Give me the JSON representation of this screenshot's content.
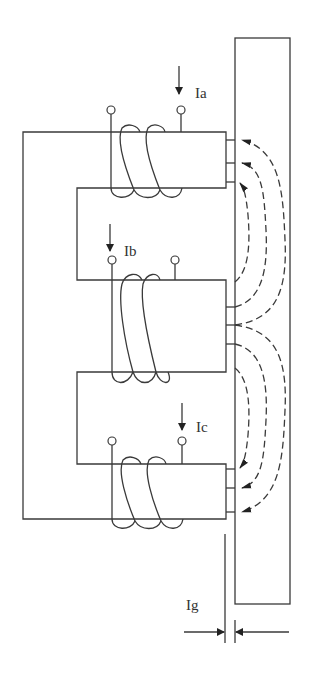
{
  "diagram": {
    "labels": {
      "phase_a_current": "Ia",
      "phase_b_current": "Ib",
      "phase_c_current": "Ic",
      "air_gap": "Ig"
    },
    "components": [
      {
        "id": "e-core",
        "type": "E-shaped core",
        "limbs": 3
      },
      {
        "id": "coil-a",
        "type": "winding",
        "on": "top limb",
        "turns_drawn": 3
      },
      {
        "id": "coil-b",
        "type": "winding",
        "on": "center limb",
        "turns_drawn": 3
      },
      {
        "id": "coil-c",
        "type": "winding",
        "on": "bottom limb",
        "turns_drawn": 3
      },
      {
        "id": "i-plate",
        "type": "I-shaped core plate"
      },
      {
        "id": "air-gap",
        "type": "gap dimension",
        "label": "Ig"
      },
      {
        "id": "flux-lines",
        "type": "dashed flux paths",
        "count": 6
      }
    ],
    "colors": {
      "line": "#3a3a3a",
      "background": "#ffffff"
    }
  }
}
